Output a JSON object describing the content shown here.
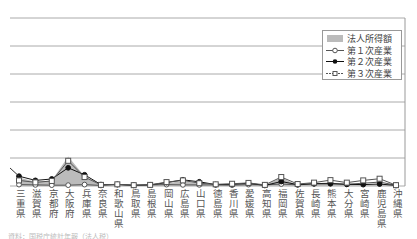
{
  "chart_data": {
    "type": "line",
    "title": "",
    "xlabel": "",
    "ylabel": "",
    "grid": true,
    "legend_position": "upper-right",
    "categories": [
      "三重県",
      "滋賀県",
      "京都府",
      "大阪府",
      "兵庫県",
      "奈良県",
      "和歌山県",
      "鳥取県",
      "島根県",
      "岡山県",
      "広島県",
      "山口県",
      "徳島県",
      "香川県",
      "愛媛県",
      "高知県",
      "福岡県",
      "佐賀県",
      "長崎県",
      "熊本県",
      "大分県",
      "宮崎県",
      "鹿児島県",
      "沖縄県"
    ],
    "series": [
      {
        "name": "法人所得額",
        "kind": "area",
        "color": "#bbbbbb",
        "values": [
          3.0,
          1.5,
          2.0,
          10.5,
          3.5,
          0.3,
          0.3,
          0.2,
          0.3,
          1.0,
          1.8,
          0.8,
          0.3,
          0.5,
          0.8,
          0.2,
          3.0,
          0.3,
          0.6,
          0.8,
          0.4,
          0.3,
          0.5,
          0.3
        ]
      },
      {
        "name": "第１次産業",
        "kind": "line-open-circle",
        "color": "#555555",
        "values": [
          0.5,
          0.4,
          0.3,
          0.3,
          0.5,
          0.2,
          0.6,
          0.2,
          0.4,
          0.5,
          0.4,
          0.4,
          0.4,
          0.3,
          0.5,
          0.4,
          0.7,
          0.4,
          0.8,
          1.0,
          0.6,
          1.0,
          1.4,
          0.3
        ]
      },
      {
        "name": "第２次産業",
        "kind": "line-filled-diamond",
        "color": "#111111",
        "values": [
          3.5,
          2.0,
          2.5,
          6.5,
          4.0,
          0.5,
          0.5,
          0.3,
          0.4,
          1.2,
          2.2,
          1.5,
          0.5,
          0.6,
          1.0,
          0.2,
          1.6,
          0.5,
          0.8,
          0.8,
          0.6,
          0.5,
          0.7,
          0.2
        ]
      },
      {
        "name": "第３次産業",
        "kind": "line-open-square",
        "color": "#555555",
        "values": [
          2.0,
          1.3,
          1.8,
          9.0,
          3.2,
          0.4,
          0.6,
          0.3,
          0.4,
          1.4,
          2.0,
          1.0,
          0.6,
          0.8,
          1.1,
          0.4,
          3.2,
          0.7,
          1.2,
          2.1,
          1.2,
          2.0,
          2.6,
          0.3
        ]
      }
    ],
    "axis": {
      "y_gridlines_px": [
        18,
        46,
        74,
        102,
        130,
        158,
        186
      ],
      "y_baseline_px": 186
    }
  },
  "legend": {
    "items": [
      {
        "label": "法人所得額",
        "marker": "gray-box"
      },
      {
        "label": "第１次産業",
        "marker": "open-circle"
      },
      {
        "label": "第２次産業",
        "marker": "filled-diamond"
      },
      {
        "label": "第３次産業",
        "marker": "open-square"
      }
    ]
  },
  "footer": {
    "source_text": "資料：国税庁統計年報（法人税）"
  }
}
